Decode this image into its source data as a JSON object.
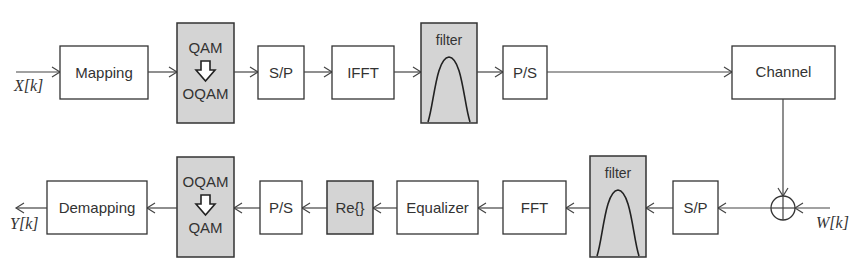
{
  "diagram": {
    "type": "block-diagram",
    "colors": {
      "block_fill": "#ffffff",
      "highlight_fill": "#d4d4d4",
      "stroke": "#333333"
    },
    "input_label": "X[k]",
    "output_label": "Y[k]",
    "noise_label": "W[k]",
    "transmitter": {
      "blocks": [
        {
          "id": "mapping",
          "label": "Mapping"
        },
        {
          "id": "qam-to-oqam",
          "label_top": "QAM",
          "label_bottom": "OQAM",
          "arrow": "down-arrow"
        },
        {
          "id": "sp-tx",
          "label": "S/P"
        },
        {
          "id": "ifft",
          "label": "IFFT"
        },
        {
          "id": "filter-tx",
          "label": "filter"
        },
        {
          "id": "ps-tx",
          "label": "P/S"
        },
        {
          "id": "channel",
          "label": "Channel"
        }
      ]
    },
    "receiver": {
      "blocks": [
        {
          "id": "sp-rx",
          "label": "S/P"
        },
        {
          "id": "filter-rx",
          "label": "filter"
        },
        {
          "id": "fft",
          "label": "FFT"
        },
        {
          "id": "equalizer",
          "label": "Equalizer"
        },
        {
          "id": "re",
          "label": "Re{}"
        },
        {
          "id": "ps-rx",
          "label": "P/S"
        },
        {
          "id": "oqam-to-qam",
          "label_top": "OQAM",
          "label_bottom": "QAM",
          "arrow": "down-arrow"
        },
        {
          "id": "demapping",
          "label": "Demapping"
        }
      ]
    },
    "adder": {
      "symbol": "circle-plus"
    }
  }
}
